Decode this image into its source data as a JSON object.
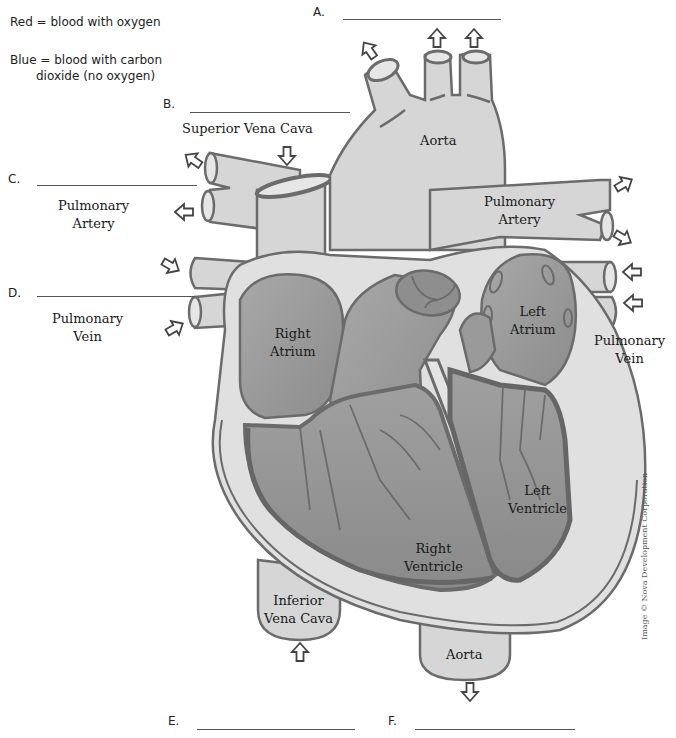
{
  "legend": {
    "red": "Red = blood with oxygen",
    "blue_line1": "Blue = blood with carbon",
    "blue_line2": "dioxide (no oxygen)"
  },
  "blanks": [
    {
      "letter": "A.",
      "answer": ""
    },
    {
      "letter": "B.",
      "answer": ""
    },
    {
      "letter": "C.",
      "answer": ""
    },
    {
      "letter": "D.",
      "answer": ""
    },
    {
      "letter": "E.",
      "answer": ""
    },
    {
      "letter": "F.",
      "answer": ""
    }
  ],
  "labels": {
    "superior_vena_cava": "Superior Vena Cava",
    "aorta_top": "Aorta",
    "pulmonary_artery_left_1": "Pulmonary",
    "pulmonary_artery_left_2": "Artery",
    "pulmonary_vein_left_1": "Pulmonary",
    "pulmonary_vein_left_2": "Vein",
    "pulmonary_artery_right_1": "Pulmonary",
    "pulmonary_artery_right_2": "Artery",
    "pulmonary_vein_right_1": "Pulmonary",
    "pulmonary_vein_right_2": "Vein",
    "right_atrium_1": "Right",
    "right_atrium_2": "Atrium",
    "left_atrium_1": "Left",
    "left_atrium_2": "Atrium",
    "right_ventricle_1": "Right",
    "right_ventricle_2": "Ventricle",
    "left_ventricle_1": "Left",
    "left_ventricle_2": "Ventricle",
    "inferior_vena_cava_1": "Inferior",
    "inferior_vena_cava_2": "Vena Cava",
    "aorta_bottom": "Aorta"
  },
  "credit": "Image © Nova Development Corporation",
  "colors": {
    "outline": "#6b6b6b",
    "vessel_fill": "#d6d6d6",
    "chamber_fill": "#9a9a9a",
    "chamber_dark": "#8a8a8a",
    "wall_fill": "#e4e4e4",
    "text": "#1a1a1a"
  }
}
